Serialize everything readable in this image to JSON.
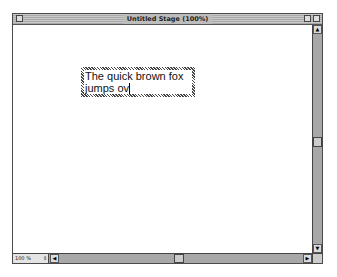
{
  "window": {
    "title": "Untitled Stage (100%)"
  },
  "stage": {
    "textbox": {
      "line1": "The quick brown fox",
      "line2": "jumps ov"
    }
  },
  "statusbar": {
    "zoom_value": "100 %",
    "zoom_stepper_glyph": "⇕"
  },
  "icons": {
    "up_arrow": "▲",
    "down_arrow": "▼",
    "left_arrow": "◀",
    "right_arrow": "▶"
  }
}
